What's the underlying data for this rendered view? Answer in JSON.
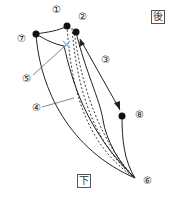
{
  "diagram": {
    "labels": {
      "l1": "①",
      "l2": "②",
      "l3": "③",
      "l4": "④",
      "l5": "⑤",
      "l6": "⑥",
      "l7": "⑦",
      "l8": "⑧"
    },
    "orientation": {
      "back": "後",
      "down": "下"
    },
    "colors": {
      "line": "#222222",
      "cross_mark": "#7fbfe6"
    }
  }
}
